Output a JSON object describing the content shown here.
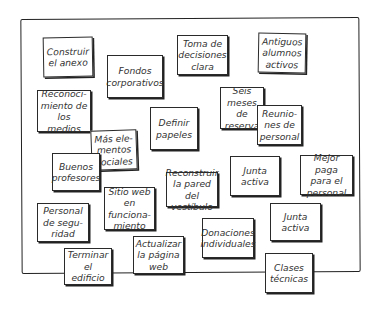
{
  "diagram": {
    "type": "affinity-board",
    "notes": [
      {
        "id": "n1",
        "text": "Construir\nel anexo"
      },
      {
        "id": "n2",
        "text": "Fondos\ncorporativos"
      },
      {
        "id": "n3",
        "text": "Toma de\ndecisiones\nclara"
      },
      {
        "id": "n4",
        "text": "Antiguos\nalumnos\nactivos"
      },
      {
        "id": "n5",
        "text": "Reconoci-\nmiento de\nlos medios"
      },
      {
        "id": "n6",
        "text": "Seis\nmeses de\nreserva"
      },
      {
        "id": "n7",
        "text": "Reunio-\nnes de\npersonal"
      },
      {
        "id": "n8",
        "text": "Definir\npapeles"
      },
      {
        "id": "n9",
        "text": "Más ele-\nmentos\nsociales"
      },
      {
        "id": "n10",
        "text": "Buenos\nprofesores"
      },
      {
        "id": "n11",
        "text": "Junta\nactiva"
      },
      {
        "id": "n12",
        "text": "Mejor paga\npara el\npersonal"
      },
      {
        "id": "n13",
        "text": "Reconstruir\nla pared del\nvestíbulo"
      },
      {
        "id": "n14",
        "text": "Sitio web en\nfunciona-\nmiento"
      },
      {
        "id": "n15",
        "text": "Personal\nde segu-\nridad"
      },
      {
        "id": "n16",
        "text": "Junta\nactiva"
      },
      {
        "id": "n17",
        "text": "Donaciones\nindividuales"
      },
      {
        "id": "n18",
        "text": "Actualizar\nla página\nweb"
      },
      {
        "id": "n19",
        "text": "Terminar\nel edificio"
      },
      {
        "id": "n20",
        "text": "Clases\ntécnicas"
      }
    ]
  }
}
